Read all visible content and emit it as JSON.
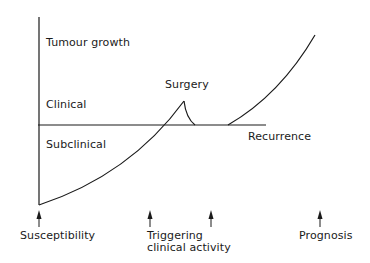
{
  "diagram": {
    "y_axis_label": "Tumour growth",
    "zones": {
      "above": "Clinical",
      "below": "Subclinical"
    },
    "threshold_label": "Recurrence",
    "peak_label": "Surgery",
    "markers": [
      {
        "label_line1": "Susceptibility",
        "label_line2": ""
      },
      {
        "label_line1": "Triggering",
        "label_line2": "clinical activity"
      },
      {
        "label_line1": "",
        "label_line2": ""
      },
      {
        "label_line1": "Prognosis",
        "label_line2": ""
      }
    ],
    "colors": {
      "line": "#1a1a1a",
      "background": "#ffffff"
    }
  }
}
